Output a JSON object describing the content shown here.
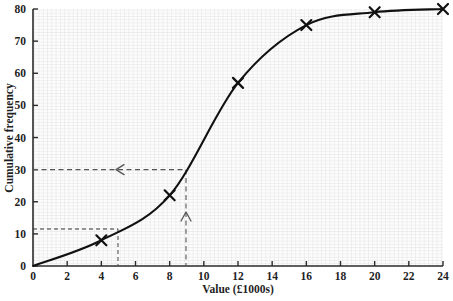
{
  "chart_data": {
    "type": "line",
    "title": "",
    "subtitle": "",
    "xlabel": "Value (£1000s)",
    "ylabel": "Cumulative frequency",
    "xlim": [
      0,
      24
    ],
    "ylim": [
      0,
      80
    ],
    "grid": true,
    "legend": "none",
    "x_ticks": [
      0,
      2,
      4,
      6,
      8,
      10,
      12,
      14,
      16,
      18,
      20,
      22,
      24
    ],
    "x_tick_labels": [
      "0",
      "2",
      "4",
      "6",
      "8",
      "10",
      "12",
      "14",
      "16",
      "18",
      "20",
      "22",
      "24"
    ],
    "y_ticks": [
      0,
      10,
      20,
      30,
      40,
      50,
      60,
      70,
      80
    ],
    "y_tick_labels": [
      "0",
      "10",
      "20",
      "30",
      "40",
      "50",
      "60",
      "70",
      "80"
    ],
    "series": [
      {
        "name": "Cumulative frequency",
        "marker": "x",
        "color": "#111111",
        "x": [
          4,
          8,
          12,
          16,
          20,
          24
        ],
        "values": [
          8,
          22,
          57,
          75,
          79,
          80
        ]
      }
    ],
    "annotations": [
      {
        "name": "median-read-off",
        "type": "dashed-guide",
        "description": "vertical dashed line up from x-axis at value 9 with upward arrow, meeting curve at cumulative frequency 30",
        "x": 9,
        "y": 30,
        "arrow": "up"
      },
      {
        "name": "cf-30-read-off",
        "type": "dashed-guide",
        "description": "horizontal dashed line at cumulative frequency 30 from curve back to y-axis with leftward arrow",
        "x": 9,
        "y": 30,
        "arrow": "left"
      },
      {
        "name": "value-5-read-off",
        "type": "dashed-guide",
        "description": "dashed lines at value 5 reading cumulative frequency 11.5",
        "x": 5,
        "y": 11.5,
        "arrow": "none"
      }
    ]
  },
  "colors": {
    "curve": "#111111",
    "axis": "#2b2b2b",
    "grid": "#d9d9d9",
    "guide": "#555555",
    "plot_background": "#fcfcfc"
  }
}
